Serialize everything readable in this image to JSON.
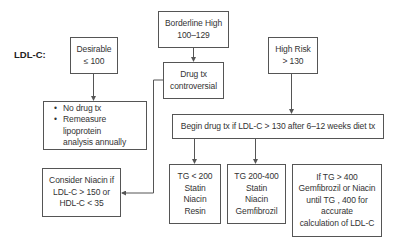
{
  "diagram": {
    "row_label": "LDL-C:",
    "nodes": {
      "desirable": {
        "lines": [
          "Desirable",
          "≤ 100"
        ]
      },
      "borderline": {
        "lines": [
          "Borderline High",
          "100–129"
        ]
      },
      "high_risk": {
        "lines": [
          "High Risk",
          "> 130"
        ]
      },
      "drug_controversial": {
        "lines": [
          "Drug tx",
          "controversial"
        ]
      },
      "no_drug": {
        "bullets": [
          "No drug tx",
          "Remeasure lipoprotein",
          "analysis annually"
        ],
        "bullet_char": "•"
      },
      "consider_niacin": {
        "lines": [
          "Consider Niacin if",
          "LDL-C > 150 or",
          "HDL-C < 35"
        ]
      },
      "begin_drug": {
        "lines": [
          "Begin drug tx if LDL-C > 130 after 6–12 weeks diet tx"
        ]
      },
      "tg_lt_200": {
        "lines": [
          "TG < 200",
          "Statin",
          "Niacin",
          "Resin"
        ]
      },
      "tg_200_400": {
        "lines": [
          "TG 200-400",
          "Statin",
          "Niacin",
          "Gemfibrozil"
        ]
      },
      "tg_gt_400": {
        "lines": [
          "If TG > 400",
          "Gemfibrozil or Niacin",
          "until TG , 400 for",
          "accurate",
          "calculation of LDL-C"
        ]
      }
    },
    "edges": [
      {
        "from": "desirable",
        "to": "no_drug"
      },
      {
        "from": "borderline",
        "to": "drug_controversial"
      },
      {
        "from": "drug_controversial",
        "to": "consider_niacin"
      },
      {
        "from": "high_risk",
        "to": "begin_drug"
      },
      {
        "from": "begin_drug",
        "to": "tg_lt_200"
      },
      {
        "from": "begin_drug",
        "to": "tg_200_400"
      }
    ],
    "colors": {
      "line": "#555555",
      "text": "#333333",
      "background": "#ffffff"
    }
  }
}
